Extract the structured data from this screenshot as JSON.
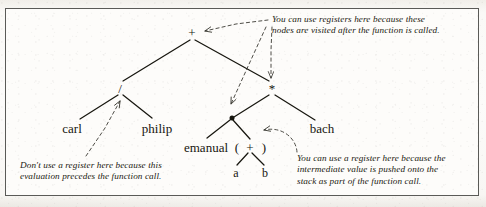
{
  "figure": {
    "kind": "expression-tree-diagram",
    "caption": "",
    "background_color": "#fdfcfa",
    "ink_color": "#17160f",
    "dashed_color": "#3a3932"
  },
  "tree": {
    "nodes": [
      {
        "id": "root-plus",
        "label": "+",
        "x": 192,
        "y": 32,
        "type": "operator"
      },
      {
        "id": "divide",
        "label": "/",
        "x": 120,
        "y": 88,
        "type": "operator"
      },
      {
        "id": "times",
        "label": "*",
        "x": 272,
        "y": 88,
        "type": "operator"
      },
      {
        "id": "carl",
        "label": "carl",
        "x": 72,
        "y": 128,
        "type": "leaf"
      },
      {
        "id": "philip",
        "label": "philip",
        "x": 157,
        "y": 128,
        "type": "leaf"
      },
      {
        "id": "call-dot",
        "label": "",
        "x": 232,
        "y": 118,
        "type": "call-node"
      },
      {
        "id": "bach",
        "label": "bach",
        "x": 322,
        "y": 128,
        "type": "leaf"
      },
      {
        "id": "emanual",
        "label": "emanual",
        "x": 206,
        "y": 147,
        "type": "leaf"
      },
      {
        "id": "open-paren",
        "label": "(",
        "x": 237,
        "y": 147,
        "type": "punctuation"
      },
      {
        "id": "inner-plus",
        "label": "+",
        "x": 250,
        "y": 147,
        "type": "operator"
      },
      {
        "id": "close-paren",
        "label": ")",
        "x": 264,
        "y": 147,
        "type": "punctuation"
      },
      {
        "id": "a",
        "label": "a",
        "x": 236,
        "y": 173,
        "type": "leaf"
      },
      {
        "id": "b",
        "label": "b",
        "x": 265,
        "y": 173,
        "type": "leaf"
      }
    ],
    "edges": [
      {
        "from": "root-plus",
        "to": "divide"
      },
      {
        "from": "root-plus",
        "to": "times"
      },
      {
        "from": "divide",
        "to": "carl"
      },
      {
        "from": "divide",
        "to": "philip"
      },
      {
        "from": "times",
        "to": "call-dot"
      },
      {
        "from": "times",
        "to": "bach"
      },
      {
        "from": "call-dot",
        "to": "emanual"
      },
      {
        "from": "call-dot",
        "to": "inner-plus"
      },
      {
        "from": "inner-plus",
        "to": "a"
      },
      {
        "from": "inner-plus",
        "to": "b"
      }
    ]
  },
  "annotations": [
    {
      "id": "annotation-registers-after-call",
      "text": "You can use registers here because these\nnodes are visited after the function is called.",
      "x": 272,
      "y": 14,
      "points_to": [
        "root-plus",
        "times",
        "call-dot"
      ]
    },
    {
      "id": "annotation-no-register",
      "text": "Don't use a register here because this\nevaluation precedes the function call.",
      "x": 20,
      "y": 160,
      "points_to": [
        "divide"
      ]
    },
    {
      "id": "annotation-register-intermediate",
      "text": "You can use a register here because the\nintermediate value is pushed onto the\nstack as part of the function call.",
      "x": 297,
      "y": 153,
      "points_to": [
        "inner-plus"
      ]
    }
  ]
}
